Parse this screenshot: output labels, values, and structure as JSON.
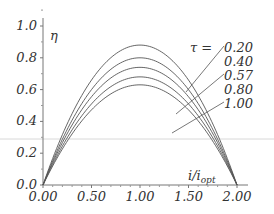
{
  "chart_data": {
    "type": "line",
    "title": "",
    "xlabel": "i/i_opt",
    "xlabel_main": "i/i",
    "xlabel_sub": "opt",
    "ylabel": "η",
    "xlim": [
      0,
      2.0
    ],
    "ylim": [
      0,
      1.0
    ],
    "x_ticks": [
      "0.00",
      "0.50",
      "1.00",
      "1.50",
      "2.00"
    ],
    "y_ticks": [
      "0.0",
      "0.2",
      "0.4",
      "0.6",
      "0.8",
      "1.0"
    ],
    "grid": false,
    "legend_title": "τ  =",
    "series": [
      {
        "name": "0.20",
        "peak": 0.88,
        "x": [
          0,
          0.5,
          1.0,
          1.5,
          2.0
        ],
        "values": [
          0,
          0.66,
          0.88,
          0.66,
          0
        ]
      },
      {
        "name": "0.40",
        "peak": 0.8,
        "x": [
          0,
          0.5,
          1.0,
          1.5,
          2.0
        ],
        "values": [
          0,
          0.6,
          0.8,
          0.6,
          0
        ]
      },
      {
        "name": "0.57",
        "peak": 0.74,
        "x": [
          0,
          0.5,
          1.0,
          1.5,
          2.0
        ],
        "values": [
          0,
          0.555,
          0.74,
          0.555,
          0
        ]
      },
      {
        "name": "0.80",
        "peak": 0.68,
        "x": [
          0,
          0.5,
          1.0,
          1.5,
          2.0
        ],
        "values": [
          0,
          0.51,
          0.68,
          0.51,
          0
        ]
      },
      {
        "name": "1.00",
        "peak": 0.63,
        "x": [
          0,
          0.5,
          1.0,
          1.5,
          2.0
        ],
        "values": [
          0,
          0.47,
          0.63,
          0.47,
          0
        ]
      }
    ],
    "line_color": "#555555"
  }
}
